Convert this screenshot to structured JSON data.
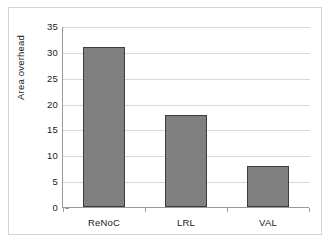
{
  "chart_data": {
    "type": "bar",
    "title": "",
    "xlabel": "",
    "ylabel": "Area overhead",
    "categories": [
      "ReNoC",
      "LRL",
      "VAL"
    ],
    "values": [
      31,
      17.8,
      8
    ],
    "ylim": [
      0,
      35
    ],
    "ytick_labels": [
      "0",
      "5",
      "10",
      "15",
      "20",
      "25",
      "30",
      "35"
    ],
    "ytick_values": [
      0,
      5,
      10,
      15,
      20,
      25,
      30,
      35
    ],
    "grid": true,
    "legend": null,
    "series": [
      {
        "name": "Area overhead",
        "values": [
          31,
          17.8,
          8
        ]
      }
    ],
    "colors": {
      "bar_fill": "#808080",
      "bar_border": "#3d3d3d",
      "gridline": "#d9d9d9",
      "axis": "#9a9a9a",
      "frame": "#d4d4d4",
      "text": "#1a1a1a",
      "background": "#ffffff"
    }
  }
}
